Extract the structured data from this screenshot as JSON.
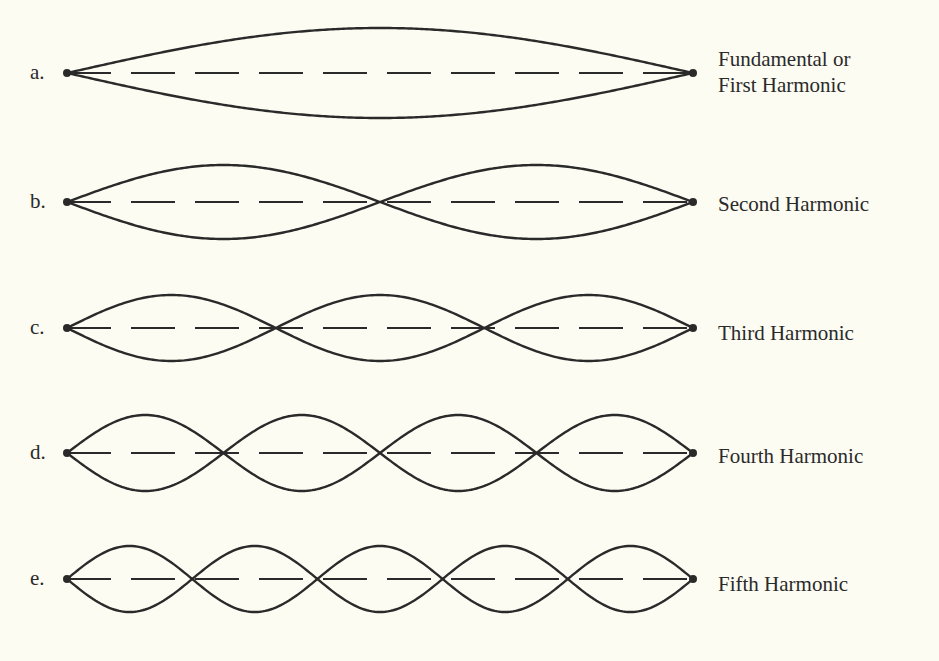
{
  "figure": {
    "rows": [
      {
        "letter": "a.",
        "title": "Fundamental or\nFirst Harmonic",
        "harmonic": 1,
        "loops": 1
      },
      {
        "letter": "b.",
        "title": "Second Harmonic",
        "harmonic": 2,
        "loops": 2
      },
      {
        "letter": "c.",
        "title": "Third Harmonic",
        "harmonic": 3,
        "loops": 3
      },
      {
        "letter": "d.",
        "title": "Fourth Harmonic",
        "harmonic": 4,
        "loops": 4
      },
      {
        "letter": "e.",
        "title": "Fifth Harmonic",
        "harmonic": 5,
        "loops": 5
      }
    ]
  },
  "colors": {
    "background": "#fdfcf3",
    "ink": "#2a2a2a"
  }
}
